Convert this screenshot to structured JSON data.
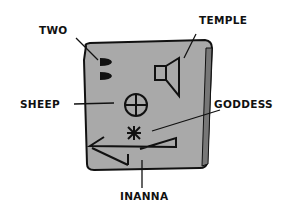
{
  "figure": {
    "colors": {
      "tablet": "#a8a8a8",
      "ink": "#111111",
      "background": "#ffffff"
    },
    "labels": {
      "two": "TWO",
      "temple": "TEMPLE",
      "sheep": "SHEEP",
      "goddess": "GODDESS",
      "inanna": "INANNA"
    }
  }
}
